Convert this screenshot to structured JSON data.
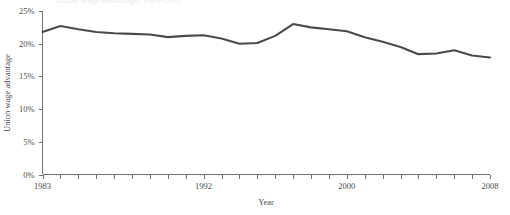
{
  "chart_data": {
    "type": "line",
    "title": "",
    "clipped_title_fragment": "Union wage advantage, 1983-2008",
    "xlabel": "Year",
    "ylabel": "Union wage advantage",
    "xlim": [
      1983,
      2008
    ],
    "ylim": [
      0,
      25
    ],
    "grid": false,
    "legend": null,
    "line_color": "#4a4a4a",
    "axis_color": "#6f6f72",
    "y_ticks": [
      0,
      5,
      10,
      15,
      20,
      25
    ],
    "y_tick_labels": [
      "0%",
      "5%",
      "10%",
      "15%",
      "20%",
      "25%"
    ],
    "x_ticks": [
      1983,
      1984,
      1985,
      1986,
      1987,
      1988,
      1989,
      1990,
      1991,
      1992,
      1993,
      1994,
      1995,
      1996,
      1997,
      1998,
      1999,
      2000,
      2001,
      2002,
      2003,
      2004,
      2005,
      2006,
      2007,
      2008
    ],
    "x_tick_labels_shown": [
      "1983",
      "1992",
      "2000",
      "2008"
    ],
    "x_tick_labels_shown_at": [
      1983,
      1992,
      2000,
      2008
    ],
    "series": [
      {
        "name": "Union wage advantage",
        "x": [
          1983,
          1984,
          1985,
          1986,
          1987,
          1988,
          1989,
          1990,
          1991,
          1992,
          1993,
          1994,
          1995,
          1996,
          1997,
          1998,
          1999,
          2000,
          2001,
          2002,
          2003,
          2004,
          2005,
          2006,
          2007,
          2008
        ],
        "values": [
          21.8,
          22.7,
          22.2,
          21.8,
          21.6,
          21.5,
          21.4,
          21.0,
          21.2,
          21.3,
          20.8,
          20.0,
          20.1,
          21.2,
          23.0,
          22.5,
          22.2,
          21.9,
          21.0,
          20.3,
          19.5,
          18.4,
          18.5,
          19.0,
          18.2,
          17.9
        ],
        "units": "percent"
      }
    ]
  }
}
